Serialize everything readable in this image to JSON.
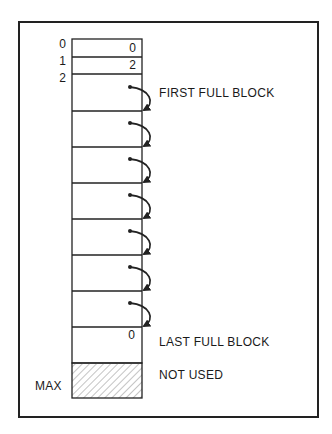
{
  "diagram": {
    "type": "memory-block-chain",
    "index_labels": [
      "0",
      "1",
      "2"
    ],
    "max_label": "MAX",
    "cells": [
      {
        "index": "0",
        "value": "0"
      },
      {
        "index": "1",
        "value": "2"
      }
    ],
    "full_block_count": 8,
    "linked_arrows": 7,
    "last_block_value": "0",
    "annotations": {
      "first": "FIRST FULL BLOCK",
      "last": "LAST FULL BLOCK",
      "unused": "NOT USED"
    },
    "colors": {
      "line": "#222222",
      "background": "#ffffff",
      "hatch": "#888888"
    }
  }
}
